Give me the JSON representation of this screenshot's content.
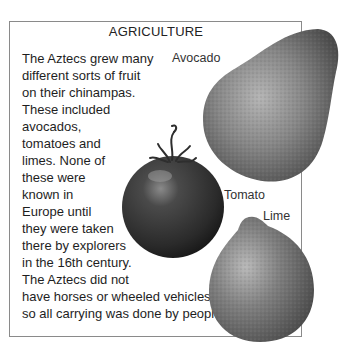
{
  "page": {
    "title": "AGRICULTURE",
    "body_lines": [
      "The Aztecs grew many",
      "different sorts of fruit",
      "on their chinampas.",
      "These included",
      "avocados,",
      "tomatoes and",
      "limes. None of",
      "these were",
      "known in",
      "Europe until",
      "they were taken",
      "there by explorers",
      "in the 16th century.",
      "The Aztecs did not",
      "have horses or wheeled vehicles,",
      "so all carrying was done by people."
    ],
    "labels": {
      "avocado": "Avocado",
      "tomato": "Tomato",
      "lime": "Lime"
    }
  },
  "colors": {
    "border": "#8a8a8a",
    "text": "#1e1e1e",
    "avocado": "#6e6e6e",
    "tomato": "#3a3a3a",
    "lime": "#707070"
  }
}
